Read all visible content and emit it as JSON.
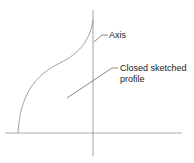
{
  "labels": {
    "axis": "Axis",
    "profile_line1": "Closed sketched",
    "profile_line2": "profile"
  },
  "colors": {
    "line": "#8a8a8a",
    "text": "#222222",
    "background": "#ffffff"
  }
}
